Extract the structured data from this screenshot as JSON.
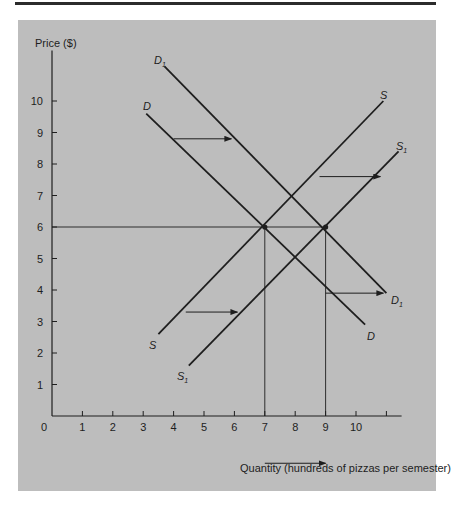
{
  "chart_data": {
    "type": "line",
    "title": "",
    "xlabel": "Quantity (hundreds of pizzas per semester)",
    "ylabel": "Price ($)",
    "x_ticks": [
      0,
      1,
      2,
      3,
      4,
      5,
      6,
      7,
      8,
      9,
      10
    ],
    "y_ticks": [
      1,
      2,
      3,
      4,
      5,
      6,
      7,
      8,
      9,
      10
    ],
    "xlim": [
      0,
      11.5
    ],
    "ylim": [
      0,
      11.5
    ],
    "grid": false,
    "series": [
      {
        "name": "D",
        "label_start": "D",
        "label_end": "D",
        "points": [
          [
            3.1,
            9.6
          ],
          [
            10.3,
            2.9
          ]
        ]
      },
      {
        "name": "D1",
        "label_start": "D1",
        "label_end": "D1",
        "points": [
          [
            3.7,
            11.1
          ],
          [
            11.0,
            3.9
          ]
        ]
      },
      {
        "name": "S",
        "label_start": "S",
        "label_end": "S",
        "points": [
          [
            3.5,
            2.6
          ],
          [
            10.9,
            10.0
          ]
        ]
      },
      {
        "name": "S1",
        "label_start": "S1",
        "label_end": "S1",
        "points": [
          [
            4.5,
            1.6
          ],
          [
            11.4,
            8.4
          ]
        ]
      }
    ],
    "equilibria": [
      {
        "x": 7,
        "y": 6,
        "curves": [
          "D",
          "S"
        ]
      },
      {
        "x": 9,
        "y": 6,
        "curves": [
          "D1",
          "S1"
        ]
      }
    ],
    "annotations": [
      {
        "type": "arrow",
        "text": "",
        "from": [
          4.0,
          8.8
        ],
        "to": [
          5.9,
          8.8
        ],
        "meaning": "demand shift right"
      },
      {
        "type": "arrow",
        "text": "",
        "from": [
          9.0,
          3.9
        ],
        "to": [
          10.9,
          3.9
        ],
        "meaning": "demand shift right"
      },
      {
        "type": "arrow",
        "text": "",
        "from": [
          4.4,
          3.3
        ],
        "to": [
          6.1,
          3.3
        ],
        "meaning": "supply shift right"
      },
      {
        "type": "arrow",
        "text": "",
        "from": [
          8.8,
          7.6
        ],
        "to": [
          10.8,
          7.6
        ],
        "meaning": "supply shift right"
      },
      {
        "type": "arrow",
        "text": "",
        "from": [
          7.0,
          -1.5
        ],
        "to": [
          9.0,
          -1.5
        ],
        "meaning": "quantity increase 7 to 9"
      },
      {
        "type": "guide",
        "text": "",
        "h_line_y": 6,
        "v_lines_x": [
          7,
          9
        ]
      }
    ],
    "legend_position": "none"
  },
  "labels": {
    "y_axis": "Price ($)",
    "x_axis": "Quantity (hundreds of pizzas per semester)",
    "curve_main": "D",
    "curve_main_shift": "D",
    "supply_main": "S",
    "supply_main_shift": "S",
    "subscript": "1"
  },
  "colors": {
    "panel": "#bdbdbd",
    "ink": "#1e1e1e",
    "rule": "#2b2b2b"
  }
}
